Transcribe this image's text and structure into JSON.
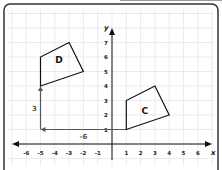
{
  "diagram": {
    "type": "coordinate-plane-translation",
    "x_axis_label": "x",
    "y_axis_label": "y",
    "x_ticks": [
      "-6",
      "-5",
      "-4",
      "-3",
      "-2",
      "-1",
      "1",
      "2",
      "3",
      "4",
      "5",
      "6"
    ],
    "x_tick_values": [
      -6,
      -5,
      -4,
      -3,
      -2,
      -1,
      1,
      2,
      3,
      4,
      5,
      6
    ],
    "y_ticks": [
      "1",
      "2",
      "3",
      "4",
      "5",
      "6",
      "7"
    ],
    "y_tick_values": [
      1,
      2,
      3,
      4,
      5,
      6,
      7
    ],
    "shapes": [
      {
        "label": "C",
        "vertices": [
          [
            1,
            1
          ],
          [
            1,
            3
          ],
          [
            3,
            4
          ],
          [
            4,
            2
          ]
        ]
      },
      {
        "label": "D",
        "vertices": [
          [
            -5,
            4
          ],
          [
            -5,
            6
          ],
          [
            -3,
            7
          ],
          [
            -2,
            5
          ]
        ]
      }
    ],
    "translation": {
      "horizontal": {
        "from": [
          1,
          1
        ],
        "to": [
          -5,
          1
        ],
        "label": "-6"
      },
      "vertical": {
        "from": [
          -5,
          1
        ],
        "to": [
          -5,
          4
        ],
        "label": "3"
      }
    },
    "colors": {
      "shape_stroke": "#111111",
      "arrow": "#555555",
      "grid": "#e6e6e6",
      "frame": "#333333"
    }
  }
}
